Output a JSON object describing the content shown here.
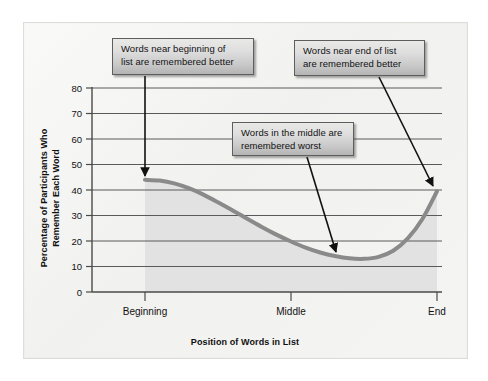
{
  "figure": {
    "background_color": "#f3f3f1",
    "frame_color": "#dcdcd8"
  },
  "annotations": [
    {
      "id": "beginning",
      "text": "Words near beginning of\nlist are remembered better",
      "arrow_from": [
        145,
        75
      ],
      "arrow_to": [
        145,
        180
      ]
    },
    {
      "id": "end",
      "text": "Words near end of list\nare remembered better",
      "arrow_from": [
        380,
        76
      ],
      "arrow_to": [
        434,
        190
      ]
    },
    {
      "id": "middle",
      "text": "Words in the middle are\nremembered worst",
      "arrow_from": [
        307,
        156
      ],
      "arrow_to": [
        336,
        255
      ]
    }
  ],
  "chart_data": {
    "type": "line",
    "title": "",
    "xlabel": "Position of Words in List",
    "ylabel": "Percentage of Participants Who Remember Each Word",
    "x_tick_labels": [
      "Beginning",
      "Middle",
      "End"
    ],
    "x_tick_positions": [
      0.0,
      0.5,
      1.0
    ],
    "y_ticks": [
      0,
      10,
      20,
      30,
      40,
      50,
      60,
      70,
      80
    ],
    "ylim": [
      0,
      80
    ],
    "xlim": [
      0,
      1
    ],
    "grid": "horizontal",
    "legend": "none",
    "line_color": "#8a8a8a",
    "line_width": 4,
    "fill_color": "#e2e2e2",
    "fill_to_zero": true,
    "series": [
      {
        "name": "Percentage remembered",
        "x": [
          0.0,
          0.05,
          0.1,
          0.15,
          0.2,
          0.25,
          0.3,
          0.35,
          0.4,
          0.45,
          0.5,
          0.55,
          0.6,
          0.65,
          0.7,
          0.75,
          0.8,
          0.85,
          0.9,
          0.95,
          1.0
        ],
        "values": [
          44,
          43.7,
          42.6,
          40.7,
          38.2,
          35.2,
          32.0,
          28.7,
          25.5,
          22.5,
          19.8,
          17.4,
          15.5,
          14.1,
          13.2,
          13.0,
          13.8,
          16.2,
          21.0,
          28.6,
          39.5
        ]
      }
    ],
    "annotations_text": [
      "Words near beginning of list are remembered better",
      "Words in the middle are remembered worst",
      "Words near end of list are remembered better"
    ]
  }
}
